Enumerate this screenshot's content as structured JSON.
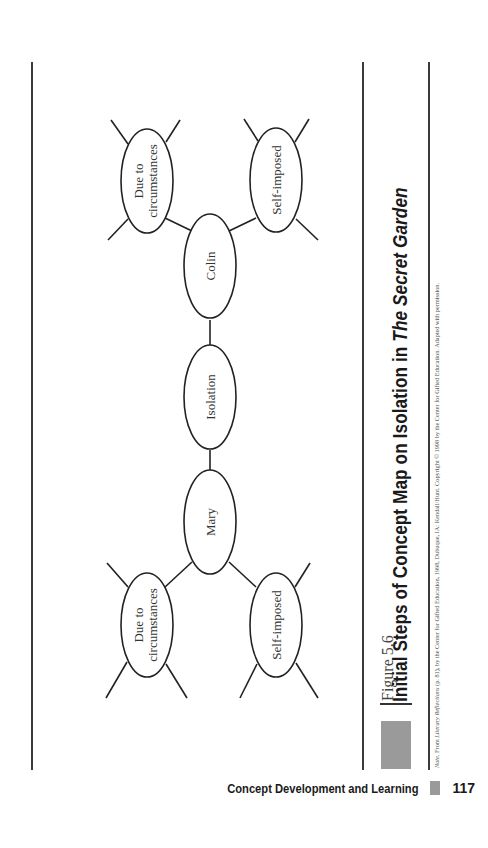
{
  "figure": {
    "label": "Figure 5.6",
    "title_prefix": "Initial Steps of Concept Map on Isolation in ",
    "title_italic": "The Secret Garden",
    "note_prefix": "Note.",
    "note_from": " From ",
    "note_source_italic": "Literary Reflections",
    "note_rest": " (p. 81), by the Center for Gifted Education, 1998, Dubuque, IA: Kendall/Hunt. Copyright © 1998 by the Center for Gifted Education. Adapted with permission."
  },
  "concept_map": {
    "center": "Isolation",
    "nodes": {
      "colin": "Colin",
      "mary": "Mary",
      "colin_left": "Due to circumstances",
      "colin_left_line1": "Due to",
      "colin_left_line2": "circumstances",
      "colin_right": "Self-imposed",
      "mary_left_line1": "Due to",
      "mary_left_line2": "circumstances",
      "mary_right": "Self-imposed"
    }
  },
  "footer": {
    "running_head": "Concept Development and Learning",
    "page_number": "117"
  },
  "colors": {
    "ink": "#1a1a1a",
    "rule": "#3a3a3a",
    "accent_gray": "#9a9a9a"
  }
}
